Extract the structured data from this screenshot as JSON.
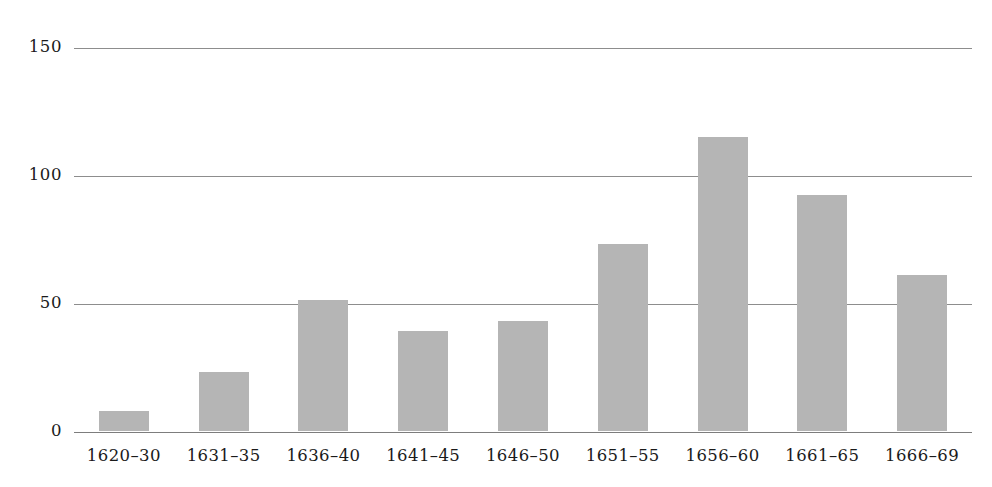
{
  "chart_data": {
    "type": "bar",
    "title": "",
    "subtitle": "",
    "xlabel": "",
    "ylabel": "",
    "categories": [
      "1620–30",
      "1631–35",
      "1636–40",
      "1641–45",
      "1646–50",
      "1651–55",
      "1656–60",
      "1661–65",
      "1666–69"
    ],
    "values": [
      8,
      23,
      51,
      39,
      43,
      73,
      115,
      92,
      61
    ],
    "ylim": [
      0,
      150
    ],
    "yticks": [
      0,
      50,
      100,
      150
    ],
    "ytick_labels": [
      "0",
      "50",
      "100",
      "150"
    ],
    "grid": "horizontal",
    "legend": "none",
    "bar_color": "#b5b5b5",
    "gridline_color": "#8d8d8d",
    "background_color": "#ffffff"
  }
}
